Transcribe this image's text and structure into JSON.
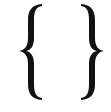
{
  "icon": {
    "name": "curly-braces-icon",
    "color": "#111111",
    "background": "#ffffff"
  }
}
